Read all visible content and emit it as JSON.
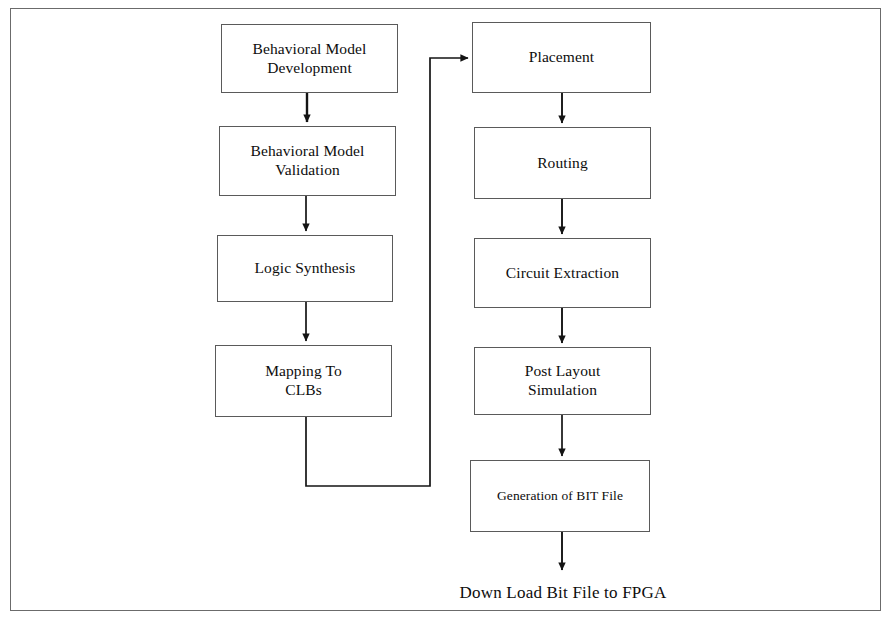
{
  "diagram": {
    "frame": {
      "stroke": "#6b6b6b"
    },
    "styles": {
      "box_stroke": "#5a5a5a",
      "line_stroke": "#1a1a1a",
      "text_color": "#0d0d0d",
      "background": "#ffffff"
    },
    "nodes": [
      {
        "id": "behavioral-model-development",
        "label": "Behavioral Model\nDevelopment",
        "column": "left",
        "x": 221,
        "y": 24,
        "w": 177,
        "h": 69
      },
      {
        "id": "behavioral-model-validation",
        "label": "Behavioral Model\nValidation",
        "column": "left",
        "x": 219,
        "y": 126,
        "w": 177,
        "h": 70
      },
      {
        "id": "logic-synthesis",
        "label": "Logic Synthesis",
        "column": "left",
        "x": 217,
        "y": 235,
        "w": 176,
        "h": 67
      },
      {
        "id": "mapping-to-clbs",
        "label": "Mapping To\nCLBs",
        "column": "left",
        "x": 215,
        "y": 345,
        "w": 177,
        "h": 72
      },
      {
        "id": "placement",
        "label": "Placement",
        "column": "right",
        "x": 472,
        "y": 22,
        "w": 179,
        "h": 71
      },
      {
        "id": "routing",
        "label": "Routing",
        "column": "right",
        "x": 474,
        "y": 127,
        "w": 177,
        "h": 72
      },
      {
        "id": "circuit-extraction",
        "label": "Circuit Extraction",
        "column": "right",
        "x": 474,
        "y": 238,
        "w": 177,
        "h": 70
      },
      {
        "id": "post-layout-simulation",
        "label": "Post Layout\nSimulation",
        "column": "right",
        "x": 474,
        "y": 347,
        "w": 177,
        "h": 68
      },
      {
        "id": "generation-of-bit-file",
        "label": "Generation of  BIT File",
        "column": "right",
        "x": 470,
        "y": 460,
        "w": 180,
        "h": 72,
        "small": true
      }
    ],
    "free_labels": [
      {
        "id": "down-load-bit-file-to-fpga",
        "text": "Down Load Bit File to FPGA",
        "x": 563,
        "y": 583
      }
    ],
    "connectors": [
      {
        "id": "dev-to-validation",
        "from": "behavioral-model-development",
        "to": "behavioral-model-validation",
        "kind": "arrow-down"
      },
      {
        "id": "validation-to-synthesis",
        "from": "behavioral-model-validation",
        "to": "logic-synthesis",
        "kind": "arrow-down"
      },
      {
        "id": "synthesis-to-mapping",
        "from": "logic-synthesis",
        "to": "mapping-to-clbs",
        "kind": "arrow-down"
      },
      {
        "id": "mapping-to-placement",
        "from": "mapping-to-clbs",
        "to": "placement",
        "kind": "elbow-right-up-arrow"
      },
      {
        "id": "placement-to-routing",
        "from": "placement",
        "to": "routing",
        "kind": "arrow-down"
      },
      {
        "id": "routing-to-extraction",
        "from": "routing",
        "to": "circuit-extraction",
        "kind": "arrow-down"
      },
      {
        "id": "extraction-to-post-layout",
        "from": "circuit-extraction",
        "to": "post-layout-simulation",
        "kind": "arrow-down"
      },
      {
        "id": "post-layout-to-bit-file",
        "from": "post-layout-simulation",
        "to": "generation-of-bit-file",
        "kind": "arrow-down"
      },
      {
        "id": "bit-file-to-download",
        "from": "generation-of-bit-file",
        "to": "down-load-bit-file-to-fpga",
        "kind": "arrow-down"
      }
    ]
  }
}
